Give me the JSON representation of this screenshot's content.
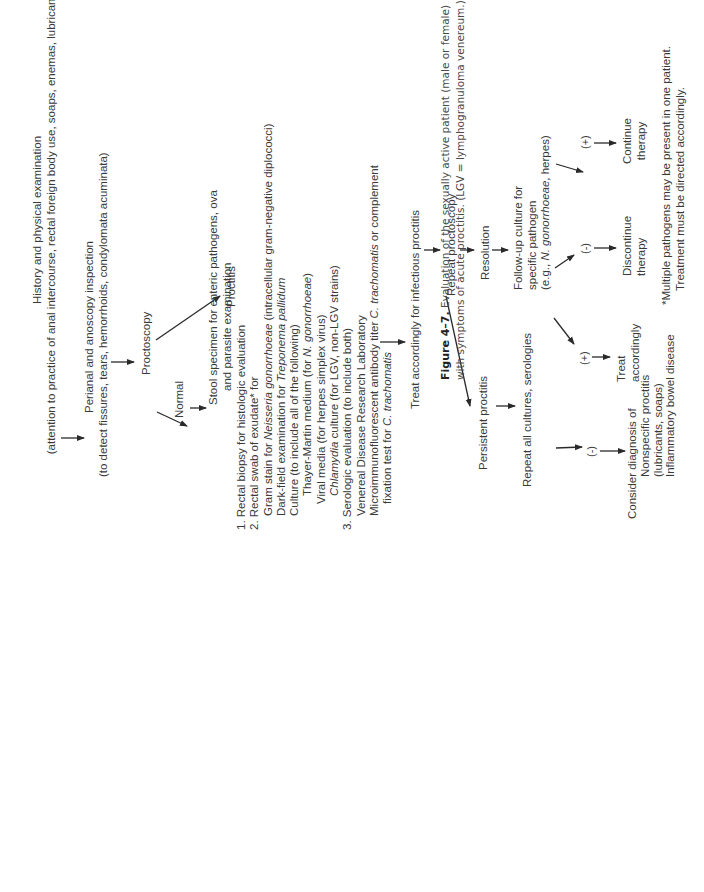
{
  "figure": {
    "caption_label": "Figure 4–7.",
    "caption_line1": "Evaluation of the sexually active patient (male or female)",
    "caption_line2": "with symptoms of acute proctitis. (LGV = lymphogranuloma venereum.)",
    "orientation": "rotated 90° counter-clockwise"
  },
  "nodes": {
    "history": {
      "line1": "History and physical examination",
      "line2": "(attention to practice of anal intercourse, rectal foreign body use, soaps, enemas, lubricants)"
    },
    "perianal": {
      "line1": "Perianal and anoscopy inspection",
      "line2": "(to detect fissures, tears, hemorrhoids, condylomata acuminata)"
    },
    "proctoscopy": "Proctoscopy",
    "normal": "Normal",
    "stool": {
      "line1": "Stool specimen for enteric pathogens, ova",
      "line2": "and parasite examination"
    },
    "proctitis": "Proctitis",
    "workup": {
      "item1": "1.  Rectal biopsy for histologic evaluation",
      "item2": "2.  Rectal swab of exudate* for",
      "gram_a": "Gram stain for ",
      "gram_b": "Neisseria gonorrhoeae",
      "gram_c": " (intracellular gram-negative diplococci)",
      "dark_a": "Dark-field examination for ",
      "dark_b": "Treponema pallidum",
      "culture": "Culture (to include all of the following)",
      "thayer_a": "Thayer-Martin medium (for ",
      "thayer_b": "N. gonorrhoeae",
      "thayer_c": ")",
      "viral": "Viral media (for herpes simplex virus)",
      "chlam_a": "Chlamydia",
      "chlam_b": " culture (for LGV, non-LGV strains)",
      "item3": "3.  Serologic evaluation (to include both)",
      "vdrl": "Venereal Disease Research Laboratory",
      "micro_a": "Microimmunofluorescent antibody titer ",
      "micro_b": "C. trachomatis",
      "micro_c": " or complement",
      "fix_a": "fixation test for ",
      "fix_b": "C. trachomatis"
    },
    "treat_infectious": "Treat accordingly for infectious proctitis",
    "repeat_proctoscopy": "Repeat proctoscopy",
    "resolution": "Resolution",
    "followup": {
      "line1": "Follow-up culture for",
      "line2": "specific pathogen",
      "line3_a": "(e.g., ",
      "line3_b": "N. gonorrhoeae",
      "line3_c": ", herpes)"
    },
    "neg_sign": "(-)",
    "pos_sign": "(+)",
    "discontinue": {
      "line1": "Discontinue",
      "line2": "therapy"
    },
    "continue": {
      "line1": "Continue",
      "line2": "therapy"
    },
    "persistent": "Persistent proctitis",
    "repeat_all": "Repeat all cultures, serologies",
    "treat_accordingly": {
      "line1": "Treat",
      "line2": "accordingly"
    },
    "consider": {
      "line1": "Consider diagnosis of",
      "line2": "Nonspecific proctitis",
      "line3": "(lubricants, soaps)",
      "line4": "Inflammatory bowel disease"
    },
    "footnote": {
      "line1": "*Multiple pathogens may be present in one patient.",
      "line2": "Treatment must be directed accordingly."
    }
  },
  "colors": {
    "text": "#3a3a3a",
    "arrow": "#2a2a2a",
    "background": "#ffffff"
  }
}
